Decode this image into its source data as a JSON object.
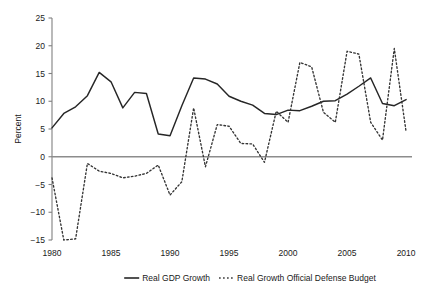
{
  "chart_data": {
    "type": "line",
    "title": "",
    "xlabel": "",
    "ylabel": "Percent",
    "xlim": [
      1980,
      2010.5
    ],
    "ylim": [
      -15,
      25
    ],
    "xticks": [
      1980,
      1985,
      1990,
      1995,
      2000,
      2005,
      2010
    ],
    "xtick_labels": [
      "1980",
      "1985",
      "1990",
      "1995",
      "2000",
      "2005",
      "2010"
    ],
    "yticks": [
      -15,
      -10,
      -5,
      0,
      5,
      10,
      15,
      20,
      25
    ],
    "ytick_labels": [
      "-15",
      "-10",
      "-5",
      "0",
      "5",
      "10",
      "15",
      "20",
      "25"
    ],
    "grid": false,
    "zero_line": true,
    "legend_position": "below",
    "x": [
      1980,
      1981,
      1982,
      1983,
      1984,
      1985,
      1986,
      1987,
      1988,
      1989,
      1990,
      1991,
      1992,
      1993,
      1994,
      1995,
      1996,
      1997,
      1998,
      1999,
      2000,
      2001,
      2002,
      2003,
      2004,
      2005,
      2006,
      2007,
      2008,
      2009,
      2010
    ],
    "series": [
      {
        "name": "Real GDP Growth",
        "style": "solid",
        "color": "#262626",
        "values": [
          5.2,
          7.8,
          9.0,
          11.0,
          15.2,
          13.5,
          8.8,
          11.6,
          11.4,
          4.1,
          3.8,
          9.2,
          14.2,
          14.0,
          13.1,
          10.9,
          10.0,
          9.3,
          7.8,
          7.6,
          8.4,
          8.3,
          9.1,
          10.0,
          10.1,
          11.3,
          12.7,
          14.2,
          9.6,
          9.2,
          10.3
        ]
      },
      {
        "name": "Real Growth Official Defense Budget",
        "style": "dotted",
        "color": "#333333",
        "values": [
          -3.8,
          -15.0,
          -14.8,
          -1.2,
          -2.6,
          -3.0,
          -3.8,
          -3.5,
          -3.0,
          -1.5,
          -6.9,
          -4.5,
          8.8,
          -1.8,
          5.8,
          5.5,
          2.4,
          2.3,
          -1.0,
          8.2,
          6.2,
          17.0,
          16.2,
          8.0,
          6.2,
          19.0,
          18.5,
          6.2,
          3.0,
          19.5,
          4.5
        ]
      }
    ],
    "legend": [
      {
        "label": "Real GDP Growth",
        "style": "solid"
      },
      {
        "label": "Real Growth Official Defense Budget",
        "style": "dotted"
      }
    ]
  }
}
